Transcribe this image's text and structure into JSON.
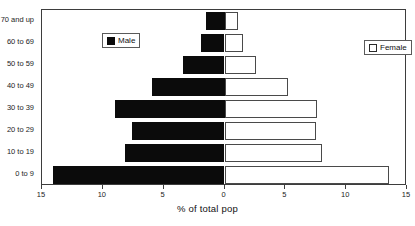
{
  "chart_data": {
    "type": "bar",
    "title": "",
    "subtitle": "",
    "xlabel": "% of total pop",
    "ylabel": "",
    "orientation": "horizontal",
    "layout": "population-pyramid",
    "grid": false,
    "legend_position": "inside-plot",
    "categories": [
      "0 to 9",
      "10 to 19",
      "20 to 29",
      "30 to 39",
      "40 to 49",
      "50 to 59",
      "60 to 69",
      "70 and up"
    ],
    "xlim": [
      -15,
      15
    ],
    "axis_max": 15,
    "xtick_labels": [
      "15",
      "10",
      "5",
      "0",
      "5",
      "10",
      "15"
    ],
    "xtick_values": [
      -15,
      -10,
      -5,
      0,
      5,
      10,
      15
    ],
    "series": [
      {
        "name": "Male",
        "side": "left",
        "color": "#0b0b0b",
        "values": [
          14.1,
          8.2,
          7.6,
          9.0,
          6.0,
          3.4,
          1.9,
          1.5
        ]
      },
      {
        "name": "Female",
        "side": "right",
        "color": "#ffffff",
        "values": [
          13.5,
          8.0,
          7.5,
          7.6,
          5.2,
          2.6,
          1.5,
          1.1
        ]
      }
    ]
  },
  "legend": {
    "male": {
      "label": "Male",
      "swatch": "filled-black-square"
    },
    "female": {
      "label": "Female",
      "swatch": "outlined-white-square"
    }
  }
}
